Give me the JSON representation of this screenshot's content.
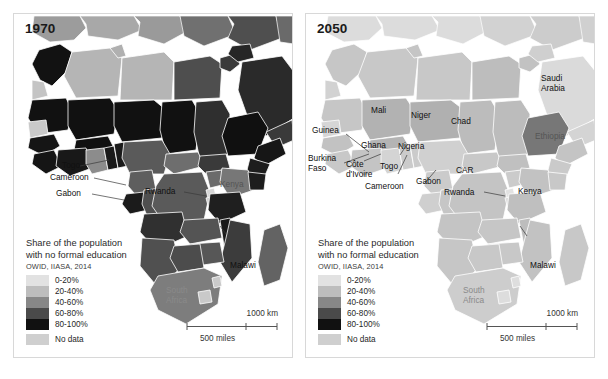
{
  "figure": {
    "kind": "two-panel-choropleth-map",
    "background": "#ffffff"
  },
  "legend_colors": {
    "c0_20": "#e2e2e2",
    "c20_40": "#bdbdbd",
    "c40_60": "#878787",
    "c60_80": "#4a4a4a",
    "c80_100": "#111111",
    "no_data": "#cfcfcf",
    "ocean": "#ffffff",
    "border": "#ffffff",
    "panel_border": "#d8d8d8"
  },
  "panels": [
    {
      "id": "left",
      "year": "1970",
      "legend": {
        "title_line1": "Share of the population",
        "title_line2": "with no formal education",
        "source": "OWID, IIASA, 2014",
        "classes": [
          {
            "label": "0-20%",
            "color": "#e2e2e2"
          },
          {
            "label": "20-40%",
            "color": "#bdbdbd"
          },
          {
            "label": "40-60%",
            "color": "#878787"
          },
          {
            "label": "60-80%",
            "color": "#4a4a4a"
          },
          {
            "label": "80-100%",
            "color": "#111111"
          }
        ],
        "no_data": {
          "label": "No data",
          "color": "#cfcfcf"
        }
      },
      "scalebar": {
        "km": "1000 km",
        "miles": "500 miles"
      },
      "labels": [
        {
          "name": "Togo",
          "text": "Togo",
          "style": "plain"
        },
        {
          "name": "Cameroon",
          "text": "Cameroon",
          "style": "plain"
        },
        {
          "name": "Gabon",
          "text": "Gabon",
          "style": "plain"
        },
        {
          "name": "Rwanda",
          "text": "Rwanda",
          "style": "plain"
        },
        {
          "name": "Kenya",
          "text": "Kenya",
          "style": "ondark"
        },
        {
          "name": "Saudi Arabia",
          "text": "Saudi",
          "text2": "Arabia",
          "style": "onblack"
        },
        {
          "name": "Malawi",
          "text": "Malawi",
          "style": "plain"
        },
        {
          "name": "South Africa",
          "text": "South",
          "text2": "Africa",
          "style": "ongray"
        }
      ]
    },
    {
      "id": "right",
      "year": "2050",
      "legend": {
        "title_line1": "Share of the population",
        "title_line2": "with no formal education",
        "source": "OWID, IIASA, 2014",
        "classes": [
          {
            "label": "0-20%",
            "color": "#e2e2e2"
          },
          {
            "label": "20-40%",
            "color": "#bdbdbd"
          },
          {
            "label": "40-60%",
            "color": "#878787"
          },
          {
            "label": "60-80%",
            "color": "#4a4a4a"
          },
          {
            "label": "80-100%",
            "color": "#111111"
          }
        ],
        "no_data": {
          "label": "No data",
          "color": "#cfcfcf"
        }
      },
      "scalebar": {
        "km": "1000 km",
        "miles": "500 miles"
      },
      "labels": [
        {
          "name": "Mali",
          "text": "Mali",
          "style": "plain"
        },
        {
          "name": "Niger",
          "text": "Niger",
          "style": "plain"
        },
        {
          "name": "Chad",
          "text": "Chad",
          "style": "plain"
        },
        {
          "name": "Saudi Arabia",
          "text": "Saudi",
          "text2": "Arabia",
          "style": "plain"
        },
        {
          "name": "Guinea",
          "text": "Guinea",
          "style": "plain"
        },
        {
          "name": "Burkina Faso",
          "text": "Burkina",
          "text2": "Faso",
          "style": "plain"
        },
        {
          "name": "Cote d'Ivoire",
          "text": "Côte",
          "text2": "d'Ivoire",
          "style": "plain"
        },
        {
          "name": "Ghana",
          "text": "Ghana",
          "style": "plain"
        },
        {
          "name": "Togo",
          "text": "Togo",
          "style": "plain"
        },
        {
          "name": "Nigeria",
          "text": "Nigeria",
          "style": "plain"
        },
        {
          "name": "Cameroon",
          "text": "Cameroon",
          "style": "plain"
        },
        {
          "name": "Gabon",
          "text": "Gabon",
          "style": "plain"
        },
        {
          "name": "CAR",
          "text": "CAR",
          "style": "plain"
        },
        {
          "name": "Ethiopia",
          "text": "Ethiopia",
          "style": "ondark"
        },
        {
          "name": "Rwanda",
          "text": "Rwanda",
          "style": "plain"
        },
        {
          "name": "Kenya",
          "text": "Kenya",
          "style": "plain"
        },
        {
          "name": "Malawi",
          "text": "Malawi",
          "style": "plain"
        },
        {
          "name": "South Africa",
          "text": "South",
          "text2": "Africa",
          "style": "ongray"
        }
      ]
    }
  ]
}
